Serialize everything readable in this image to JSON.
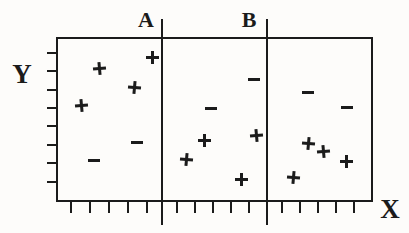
{
  "chart_data": {
    "type": "scatter",
    "title": "",
    "xlabel": "X",
    "ylabel": "Y",
    "xlim": [
      0,
      1
    ],
    "ylim": [
      0,
      1
    ],
    "grid": false,
    "axes_have_numeric_labels": false,
    "vertical_lines": [
      {
        "label": "A",
        "x": 0.334
      },
      {
        "label": "B",
        "x": 0.666
      }
    ],
    "series": [
      {
        "name": "positive-class",
        "marker": "+",
        "points": [
          [
            0.136,
            0.807
          ],
          [
            0.303,
            0.873
          ],
          [
            0.249,
            0.693
          ],
          [
            0.079,
            0.584
          ],
          [
            0.47,
            0.373
          ],
          [
            0.413,
            0.259
          ],
          [
            0.634,
            0.404
          ],
          [
            0.584,
            0.139
          ],
          [
            0.795,
            0.355
          ],
          [
            0.845,
            0.307
          ],
          [
            0.915,
            0.247
          ],
          [
            0.748,
            0.151
          ]
        ]
      },
      {
        "name": "negative-class",
        "marker": "−",
        "points": [
          [
            0.256,
            0.361
          ],
          [
            0.12,
            0.253
          ],
          [
            0.625,
            0.741
          ],
          [
            0.489,
            0.566
          ],
          [
            0.795,
            0.663
          ],
          [
            0.918,
            0.572
          ]
        ]
      }
    ],
    "x_tick_positions": [
      0.047,
      0.107,
      0.167,
      0.227,
      0.287,
      0.382,
      0.438,
      0.495,
      0.552,
      0.609,
      0.713,
      0.77,
      0.826,
      0.883,
      0.94
    ],
    "y_tick_positions": [
      0.904,
      0.792,
      0.681,
      0.569,
      0.458,
      0.346,
      0.235,
      0.123
    ]
  },
  "colors": {
    "ink": "#1b1b1b",
    "background": "#fdfcfa"
  }
}
